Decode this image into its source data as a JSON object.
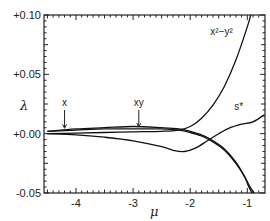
{
  "chart_data": {
    "type": "line",
    "title": "",
    "xlabel": "μ",
    "ylabel": "λ",
    "xlim": [
      -4.56,
      -0.69
    ],
    "ylim": [
      -0.05,
      0.1
    ],
    "grid": false,
    "legend": "none (curves labeled inline)",
    "x_ticks": [
      -4,
      -3,
      -2,
      -1
    ],
    "x_tick_labels": [
      "-4",
      "-3",
      "-2",
      "-1"
    ],
    "y_ticks": [
      -0.05,
      0.0,
      0.05,
      0.1
    ],
    "y_tick_labels": [
      "-0.05",
      "+0.00",
      "+0.05",
      "+0.10"
    ],
    "annotations": [
      {
        "text": "x",
        "x": -4.2,
        "arrow_to_y": 0.002
      },
      {
        "text": "xy",
        "x": -2.9,
        "arrow_to_y": 0.003
      },
      {
        "text": "x²−y²",
        "x": -1.45,
        "y": 0.083
      },
      {
        "text": "s*",
        "x": -1.15,
        "y": 0.02
      }
    ],
    "series": [
      {
        "name": "x²−y²",
        "x": [
          -4.5,
          -4.0,
          -3.5,
          -3.0,
          -2.5,
          -2.2,
          -2.0,
          -1.8,
          -1.6,
          -1.4,
          -1.2,
          -1.0,
          -0.94
        ],
        "y": [
          0.0,
          0.0005,
          0.001,
          0.0015,
          0.002,
          0.003,
          0.006,
          0.013,
          0.024,
          0.04,
          0.062,
          0.09,
          0.1
        ]
      },
      {
        "name": "s*",
        "x": [
          -4.5,
          -4.0,
          -3.5,
          -3.0,
          -2.5,
          -2.3,
          -2.1,
          -1.9,
          -1.7,
          -1.5,
          -1.3,
          -1.1,
          -0.9,
          -0.7
        ],
        "y": [
          0.0,
          -0.001,
          -0.003,
          -0.006,
          -0.011,
          -0.014,
          -0.015,
          -0.012,
          -0.006,
          0.0,
          0.005,
          0.008,
          0.01,
          0.016
        ]
      },
      {
        "name": "x",
        "x": [
          -4.5,
          -4.0,
          -3.5,
          -3.0,
          -2.5,
          -2.2,
          -2.0,
          -1.8,
          -1.6,
          -1.4,
          -1.2,
          -1.05,
          -0.95,
          -0.88
        ],
        "y": [
          0.002,
          0.003,
          0.004,
          0.004,
          0.004,
          0.003,
          0.001,
          -0.002,
          -0.007,
          -0.014,
          -0.025,
          -0.036,
          -0.045,
          -0.05
        ]
      },
      {
        "name": "xy",
        "x": [
          -4.5,
          -4.0,
          -3.5,
          -3.0,
          -2.5,
          -2.2,
          -2.0,
          -1.8,
          -1.6,
          -1.4,
          -1.2,
          -1.05,
          -0.98,
          -0.92
        ],
        "y": [
          0.002,
          0.004,
          0.005,
          0.006,
          0.005,
          0.004,
          0.002,
          -0.001,
          -0.006,
          -0.013,
          -0.024,
          -0.036,
          -0.044,
          -0.05
        ]
      }
    ]
  }
}
